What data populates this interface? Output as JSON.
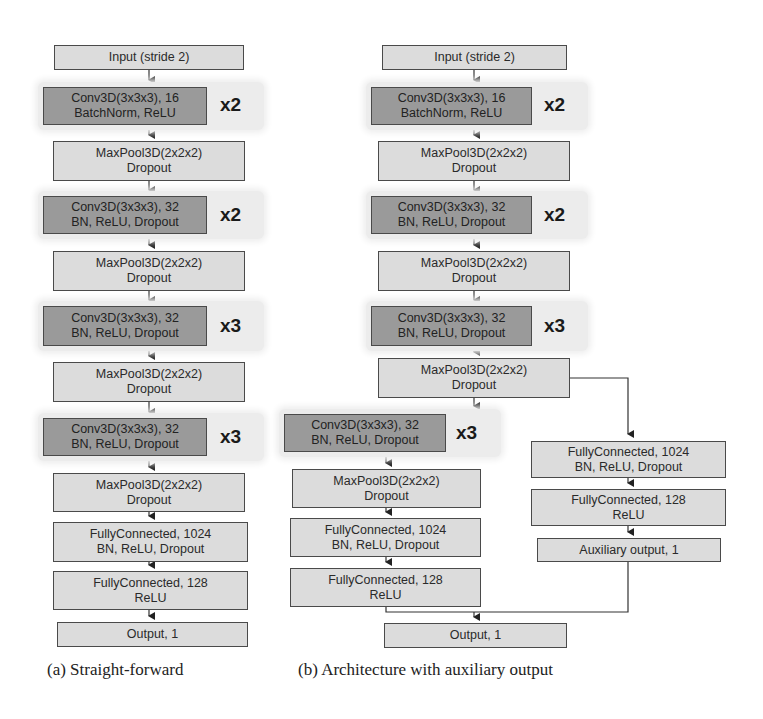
{
  "figure": {
    "panel_a": {
      "caption": "(a) Straight-forward",
      "layers": [
        {
          "id": "a-input",
          "lines": [
            "Input (stride 2)"
          ],
          "style": "light"
        },
        {
          "id": "a-conv1",
          "lines": [
            "Conv3D(3x3x3), 16",
            "BatchNorm, ReLU"
          ],
          "style": "dark",
          "repeat": "x2"
        },
        {
          "id": "a-pool1",
          "lines": [
            "MaxPool3D(2x2x2)",
            "Dropout"
          ],
          "style": "light"
        },
        {
          "id": "a-conv2",
          "lines": [
            "Conv3D(3x3x3), 32",
            "BN, ReLU, Dropout"
          ],
          "style": "dark",
          "repeat": "x2"
        },
        {
          "id": "a-pool2",
          "lines": [
            "MaxPool3D(2x2x2)",
            "Dropout"
          ],
          "style": "light"
        },
        {
          "id": "a-conv3",
          "lines": [
            "Conv3D(3x3x3), 32",
            "BN, ReLU, Dropout"
          ],
          "style": "dark",
          "repeat": "x3"
        },
        {
          "id": "a-pool3",
          "lines": [
            "MaxPool3D(2x2x2)",
            "Dropout"
          ],
          "style": "light"
        },
        {
          "id": "a-conv4",
          "lines": [
            "Conv3D(3x3x3), 32",
            "BN, ReLU, Dropout"
          ],
          "style": "dark",
          "repeat": "x3"
        },
        {
          "id": "a-pool4",
          "lines": [
            "MaxPool3D(2x2x2)",
            "Dropout"
          ],
          "style": "light"
        },
        {
          "id": "a-fc1",
          "lines": [
            "FullyConnected, 1024",
            "BN, ReLU, Dropout"
          ],
          "style": "light"
        },
        {
          "id": "a-fc2",
          "lines": [
            "FullyConnected, 128",
            "ReLU"
          ],
          "style": "light"
        },
        {
          "id": "a-out",
          "lines": [
            "Output, 1"
          ],
          "style": "light"
        }
      ]
    },
    "panel_b": {
      "caption": "(b) Architecture with auxiliary output",
      "main_branch": [
        {
          "id": "b-input",
          "lines": [
            "Input (stride 2)"
          ],
          "style": "light"
        },
        {
          "id": "b-conv1",
          "lines": [
            "Conv3D(3x3x3), 16",
            "BatchNorm, ReLU"
          ],
          "style": "dark",
          "repeat": "x2"
        },
        {
          "id": "b-pool1",
          "lines": [
            "MaxPool3D(2x2x2)",
            "Dropout"
          ],
          "style": "light"
        },
        {
          "id": "b-conv2",
          "lines": [
            "Conv3D(3x3x3), 32",
            "BN, ReLU, Dropout"
          ],
          "style": "dark",
          "repeat": "x2"
        },
        {
          "id": "b-pool2",
          "lines": [
            "MaxPool3D(2x2x2)",
            "Dropout"
          ],
          "style": "light"
        },
        {
          "id": "b-conv3",
          "lines": [
            "Conv3D(3x3x3), 32",
            "BN, ReLU, Dropout"
          ],
          "style": "dark",
          "repeat": "x3"
        },
        {
          "id": "b-pool3",
          "lines": [
            "MaxPool3D(2x2x2)",
            "Dropout"
          ],
          "style": "light"
        },
        {
          "id": "b-conv4",
          "lines": [
            "Conv3D(3x3x3), 32",
            "BN, ReLU, Dropout"
          ],
          "style": "dark",
          "repeat": "x3"
        },
        {
          "id": "b-pool4",
          "lines": [
            "MaxPool3D(2x2x2)",
            "Dropout"
          ],
          "style": "light"
        },
        {
          "id": "b-fc1",
          "lines": [
            "FullyConnected, 1024",
            "BN, ReLU, Dropout"
          ],
          "style": "light"
        },
        {
          "id": "b-fc2",
          "lines": [
            "FullyConnected, 128",
            "ReLU"
          ],
          "style": "light"
        },
        {
          "id": "b-out",
          "lines": [
            "Output, 1"
          ],
          "style": "light"
        }
      ],
      "aux_branch": [
        {
          "id": "b-aux-fc1",
          "lines": [
            "FullyConnected, 1024",
            "BN, ReLU, Dropout"
          ],
          "style": "light"
        },
        {
          "id": "b-aux-fc2",
          "lines": [
            "FullyConnected, 128",
            "ReLU"
          ],
          "style": "light"
        },
        {
          "id": "b-aux-out",
          "lines": [
            "Auxiliary output, 1"
          ],
          "style": "light"
        }
      ]
    },
    "colors": {
      "light_fill": "#dcdcdc",
      "dark_fill": "#9a9a9a",
      "border": "#4a4a4a",
      "group_bg": "#ececec"
    }
  }
}
